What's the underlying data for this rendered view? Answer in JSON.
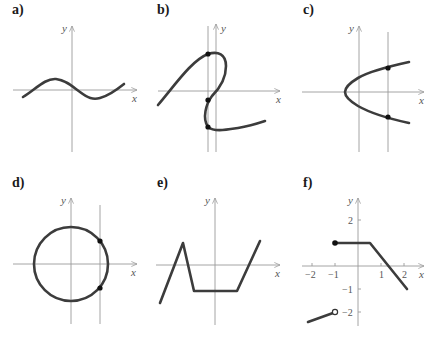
{
  "panels": [
    {
      "id": "a",
      "label": "a)",
      "x_axis_label": "x",
      "y_axis_label": "y",
      "description": "sinusoidal curve"
    },
    {
      "id": "b",
      "label": "b)",
      "x_axis_label": "x",
      "y_axis_label": "y",
      "description": "S-shaped curve with vertical line crossing at three points"
    },
    {
      "id": "c",
      "label": "c)",
      "x_axis_label": "x",
      "y_axis_label": "y",
      "description": "sideways parabola opening right with vertical line crossing at two points"
    },
    {
      "id": "d",
      "label": "d)",
      "x_axis_label": "x",
      "y_axis_label": "y",
      "description": "circle centered at origin with vertical line crossing at two points"
    },
    {
      "id": "e",
      "label": "e)",
      "x_axis_label": "x",
      "y_axis_label": "y",
      "description": "piecewise linear zigzag"
    },
    {
      "id": "f",
      "label": "f)",
      "x_axis_label": "x",
      "y_axis_label": "y",
      "description": "piecewise function with filled and open endpoints",
      "x_ticks": [
        "−2",
        "−1",
        "1",
        "2"
      ],
      "y_ticks": [
        "2",
        "−1",
        "−2"
      ],
      "segments": [
        {
          "from": [
            -2.2,
            -2.4
          ],
          "to": [
            -1,
            -2
          ],
          "end": "open"
        },
        {
          "from": [
            -1,
            1
          ],
          "to": [
            0.5,
            1
          ],
          "start": "filled"
        },
        {
          "from": [
            0.5,
            1
          ],
          "to": [
            2.1,
            -1
          ]
        }
      ]
    }
  ],
  "colors": {
    "curve": "#3c3c3c",
    "axis": "#9a9a9a",
    "point": "#111111"
  }
}
